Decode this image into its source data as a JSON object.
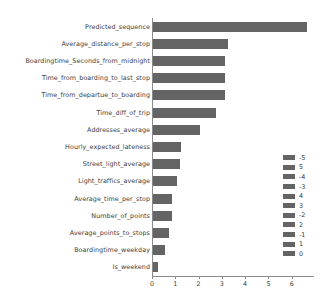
{
  "chart_data": {
    "type": "bar",
    "orientation": "horizontal",
    "title": "",
    "xlabel": "",
    "ylabel": "",
    "xlim": [
      0,
      6.87
    ],
    "grid": false,
    "bar_color": "#646464",
    "legend_position": "right",
    "categories": [
      "Predicted_sequence",
      "Average_distance_per_stop",
      "Boardingtime_Seconds_from_midnight",
      "Time_from_boarding_to_last_stop",
      "Time_from_departue_to_boarding",
      "Time_diff_of_trip",
      "Addresses_average",
      "Hourly_expected_lateness",
      "Street_light_average",
      "Light_traffics_average",
      "Average_time_per_stop",
      "Number_of_points",
      "Average_points_to_stops",
      "Boardingtime_weekday",
      "Is_weekend"
    ],
    "values": [
      6.6,
      3.2,
      3.1,
      3.1,
      3.1,
      2.7,
      2.0,
      1.2,
      1.15,
      1.05,
      0.8,
      0.8,
      0.7,
      0.5,
      0.2
    ],
    "xticks": [
      0,
      1,
      2,
      3,
      4,
      5,
      6
    ],
    "xtick_labels": [
      "0",
      "1",
      "2",
      "3",
      "4",
      "5",
      "6"
    ],
    "legend_entries": [
      "-5",
      "5",
      "-4",
      "-3",
      "4",
      "3",
      "-2",
      "2",
      "-1",
      "1",
      "0"
    ]
  }
}
